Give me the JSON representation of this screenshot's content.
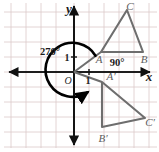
{
  "figure": {
    "background_color": "#ffffff",
    "grid_color": "#d9c9c9",
    "axis_color": "#101010",
    "shape_color": "#6e6e6e",
    "arc_color": "#000000"
  },
  "axes": {
    "x_label": "x",
    "y_label": "y",
    "origin_label": "O",
    "unit_label_y": "1",
    "unit_label_x": "1"
  },
  "angles": {
    "rotation_label": "270°",
    "interior_label": "90°"
  },
  "grid": {
    "cell_size": 15,
    "x_lines": [
      11,
      26,
      41,
      56,
      71,
      86,
      101,
      116,
      131,
      146
    ],
    "y_lines": [
      3,
      18,
      33,
      48,
      63,
      78,
      93,
      108,
      123,
      138
    ],
    "origin_px": [
      74,
      72
    ]
  },
  "shapes": [
    {
      "name": "triangle-abc",
      "kind": "preimage",
      "color": "#6e6e6e",
      "vertices": [
        {
          "label": "A",
          "px": [
            101,
            52
          ],
          "label_px": [
            96,
            62
          ]
        },
        {
          "label": "B",
          "px": [
            143,
            52
          ],
          "label_px": [
            139,
            63
          ]
        },
        {
          "label": "C",
          "px": [
            127,
            10
          ],
          "label_px": [
            127,
            10
          ]
        }
      ]
    },
    {
      "name": "triangle-a-prime-b-prime-c-prime",
      "kind": "image",
      "color": "#6e6e6e",
      "vertices": [
        {
          "label": "A′",
          "px": [
            102,
            82
          ],
          "label_px": [
            106,
            80
          ]
        },
        {
          "label": "B′",
          "px": [
            102,
            127
          ],
          "label_px": [
            99,
            139
          ]
        },
        {
          "label": "C′",
          "px": [
            145,
            118
          ],
          "label_px": [
            143,
            123
          ]
        }
      ]
    }
  ],
  "rays": [
    {
      "name": "ray-to-a",
      "from_px": [
        74,
        72
      ],
      "to_px": [
        101,
        52
      ]
    },
    {
      "name": "ray-to-a-prime",
      "from_px": [
        74,
        72
      ],
      "to_px": [
        102,
        82
      ]
    }
  ],
  "rotation_arc": {
    "center_px": [
      74,
      72
    ],
    "radius": 27,
    "start_angle_deg": 36,
    "sweep_deg": 270,
    "direction": "clockwise-visual-270",
    "arrow_at": "end"
  }
}
